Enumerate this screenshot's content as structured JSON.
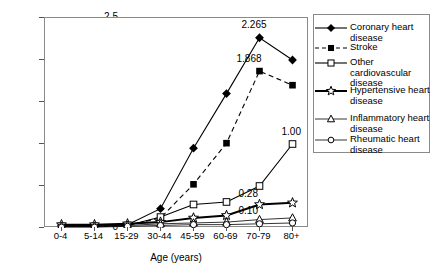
{
  "chart_data": {
    "type": "line",
    "title": "",
    "xlabel": "Age (years)",
    "ylabel": "Population (million)",
    "categories": [
      "0-4",
      "5-14",
      "15-29",
      "30-44",
      "45-59",
      "60-69",
      "70-79",
      "80+"
    ],
    "ylim": [
      0,
      2.5
    ],
    "yticks": [
      "0",
      "0.5",
      "1.0",
      "1.5",
      "2.0",
      "2.5"
    ],
    "ytick_values": [
      0,
      0.5,
      1.0,
      1.5,
      2.0,
      2.5
    ],
    "grid": false,
    "legend_position": "right",
    "series": [
      {
        "name": "Coronary heart disease",
        "marker": "filled-diamond",
        "dash": "solid",
        "values": [
          0.03,
          0.03,
          0.04,
          0.23,
          0.95,
          1.6,
          2.265,
          2.0
        ]
      },
      {
        "name": "Stroke",
        "marker": "filled-square",
        "dash": "dashed",
        "values": [
          0.02,
          0.02,
          0.03,
          0.12,
          0.52,
          1.01,
          1.868,
          1.7
        ]
      },
      {
        "name": "Other cardiovascular disease",
        "marker": "open-square",
        "dash": "solid",
        "values": [
          0.02,
          0.02,
          0.03,
          0.13,
          0.28,
          0.31,
          0.5,
          1.0
        ]
      },
      {
        "name": "Hypertensive heart disease",
        "marker": "star",
        "dash": "solid",
        "values": [
          0.04,
          0.04,
          0.05,
          0.07,
          0.12,
          0.15,
          0.28,
          0.3
        ]
      },
      {
        "name": "Inflammatory heart disease",
        "marker": "open-triangle",
        "dash": "solid",
        "values": [
          0.02,
          0.02,
          0.03,
          0.05,
          0.06,
          0.07,
          0.1,
          0.12
        ]
      },
      {
        "name": "Rheumatic heart disease",
        "marker": "open-circle",
        "dash": "solid",
        "values": [
          0.01,
          0.01,
          0.02,
          0.03,
          0.04,
          0.04,
          0.05,
          0.06
        ]
      }
    ],
    "annotations": [
      {
        "text": "2.265",
        "series": "Coronary heart disease",
        "category": "70-79"
      },
      {
        "text": "1.868",
        "series": "Stroke",
        "category": "70-79"
      },
      {
        "text": "1.00",
        "series": "Other cardiovascular disease",
        "category": "80+"
      },
      {
        "text": "0.28",
        "series": "Hypertensive heart disease",
        "category": "70-79"
      },
      {
        "text": "0.10",
        "series": "Inflammatory heart disease",
        "category": "70-79"
      }
    ]
  },
  "colors": {
    "ink": "#000000",
    "frame": "#8a8a8a",
    "background": "#ffffff"
  }
}
